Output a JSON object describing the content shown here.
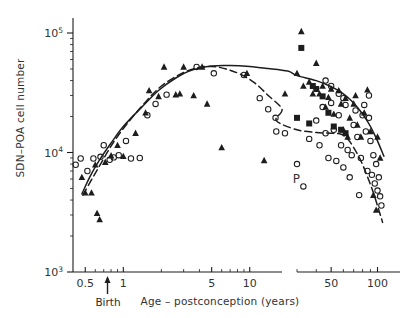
{
  "axes": {
    "ylabel": "SDN–POA cell number",
    "xlabel": "Age – postconception (years)",
    "birth_label": "Birth",
    "ytick_labels": [
      "10³",
      "10⁴",
      "10⁵"
    ],
    "xtick_labels": [
      "0.5",
      "1",
      "5",
      "10",
      "50",
      "100"
    ],
    "point_label": "P"
  },
  "chart_data": {
    "type": "scatter",
    "title": "",
    "xlabel": "Age – postconception (years)",
    "ylabel": "SDN–POA cell number",
    "xscale": "log",
    "yscale": "log",
    "xlim": [
      0.38,
      140
    ],
    "ylim": [
      1000,
      160000
    ],
    "axis_break": {
      "from": 18,
      "to": 30,
      "note": "break in x axis between 10 and 50 decades"
    },
    "grid": false,
    "legend": false,
    "ytick_values": [
      1000,
      10000,
      100000
    ],
    "ytick_labels": [
      "10³",
      "10⁴",
      "10⁵"
    ],
    "xtick_values": [
      0.5,
      1,
      5,
      10,
      50,
      100
    ],
    "xtick_labels": [
      "0.5",
      "1",
      "5",
      "10",
      "50",
      "100"
    ],
    "annotations": [
      {
        "text": "Birth",
        "x": 0.75,
        "y": 1000,
        "kind": "arrow-up-axis"
      },
      {
        "text": "P",
        "x": 33,
        "y": 5200,
        "kind": "point-label"
      }
    ],
    "series": [
      {
        "name": "male (filled triangles)",
        "marker": "triangle-filled",
        "color": "#000000",
        "points": [
          [
            0.47,
            6200
          ],
          [
            0.5,
            4600
          ],
          [
            0.56,
            4600
          ],
          [
            0.62,
            3100
          ],
          [
            0.65,
            2750
          ],
          [
            0.6,
            7900
          ],
          [
            0.72,
            8300
          ],
          [
            0.8,
            9400
          ],
          [
            0.9,
            11500
          ],
          [
            1.0,
            9300
          ],
          [
            1.25,
            14500
          ],
          [
            1.5,
            21500
          ],
          [
            1.6,
            33000
          ],
          [
            1.9,
            29500
          ],
          [
            2.1,
            52000
          ],
          [
            2.6,
            30500
          ],
          [
            2.8,
            31000
          ],
          [
            3.0,
            52000
          ],
          [
            3.6,
            30000
          ],
          [
            4.2,
            52000
          ],
          [
            4.6,
            25500
          ],
          [
            6.0,
            11000
          ],
          [
            9.5,
            46000
          ],
          [
            13.0,
            8600
          ],
          [
            19.0,
            31000
          ],
          [
            30.0,
            46000
          ],
          [
            32.0,
            103000
          ],
          [
            33.0,
            36000
          ],
          [
            36.0,
            39000
          ],
          [
            38.0,
            31000
          ],
          [
            40.0,
            56000
          ],
          [
            42.0,
            31000
          ],
          [
            44.0,
            36000
          ],
          [
            46.0,
            24000
          ],
          [
            48.0,
            29000
          ],
          [
            50.0,
            34000
          ],
          [
            52.0,
            21000
          ],
          [
            56.0,
            33000
          ],
          [
            58.0,
            25500
          ],
          [
            60.0,
            15500
          ],
          [
            62.0,
            28500
          ],
          [
            64.0,
            13500
          ],
          [
            66.0,
            19500
          ],
          [
            70.0,
            25500
          ],
          [
            72.0,
            30000
          ],
          [
            74.0,
            17000
          ],
          [
            78.0,
            13500
          ],
          [
            82.0,
            21500
          ],
          [
            86.0,
            33500
          ],
          [
            90.0,
            15000
          ],
          [
            94.0,
            4400
          ],
          [
            98.0,
            3300
          ],
          [
            100.0,
            13500
          ],
          [
            104.0,
            9000
          ]
        ]
      },
      {
        "name": "female (open circles)",
        "marker": "circle-open",
        "color": "#000000",
        "points": [
          [
            0.42,
            7900
          ],
          [
            0.46,
            8900
          ],
          [
            0.52,
            7000
          ],
          [
            0.58,
            8900
          ],
          [
            0.66,
            9200
          ],
          [
            0.7,
            11500
          ],
          [
            0.78,
            8700
          ],
          [
            0.84,
            9100
          ],
          [
            0.92,
            9500
          ],
          [
            1.05,
            12500
          ],
          [
            1.15,
            8900
          ],
          [
            1.35,
            9000
          ],
          [
            1.55,
            20500
          ],
          [
            1.8,
            25500
          ],
          [
            2.2,
            30500
          ],
          [
            3.8,
            52000
          ],
          [
            5.2,
            46000
          ],
          [
            9.0,
            44500
          ],
          [
            12.0,
            28500
          ],
          [
            14.0,
            23000
          ],
          [
            16.0,
            19500
          ],
          [
            19.0,
            14500
          ],
          [
            22.0,
            15000
          ],
          [
            33.0,
            5200
          ],
          [
            30.0,
            8000
          ],
          [
            36.0,
            13000
          ],
          [
            40.0,
            18500
          ],
          [
            42.0,
            11500
          ],
          [
            44.0,
            24000
          ],
          [
            46.0,
            14500
          ],
          [
            48.0,
            9000
          ],
          [
            50.0,
            26000
          ],
          [
            52.0,
            15500
          ],
          [
            54.0,
            8500
          ],
          [
            56.0,
            20500
          ],
          [
            58.0,
            11500
          ],
          [
            60.0,
            7500
          ],
          [
            62.0,
            25000
          ],
          [
            64.0,
            10500
          ],
          [
            66.0,
            6200
          ],
          [
            68.0,
            9500
          ],
          [
            70.0,
            17000
          ],
          [
            72.0,
            22500
          ],
          [
            74.0,
            13500
          ],
          [
            76.0,
            4400
          ],
          [
            78.0,
            9000
          ],
          [
            80.0,
            20500
          ],
          [
            82.0,
            25000
          ],
          [
            84.0,
            15000
          ],
          [
            86.0,
            7000
          ],
          [
            88.0,
            19500
          ],
          [
            90.0,
            12500
          ],
          [
            92.0,
            6500
          ],
          [
            94.0,
            9500
          ],
          [
            96.0,
            5500
          ],
          [
            98.0,
            8000
          ],
          [
            100.0,
            4800
          ],
          [
            102.0,
            6200
          ],
          [
            104.0,
            4300
          ],
          [
            106.0,
            3600
          ],
          [
            46.0,
            40000
          ],
          [
            50.0,
            36000
          ],
          [
            56.0,
            31000
          ],
          [
            60.0,
            28500
          ],
          [
            88.0,
            30000
          ]
        ]
      },
      {
        "name": "filled squares",
        "marker": "square-filled",
        "color": "#000000",
        "points": [
          [
            32.0,
            75000
          ],
          [
            38.0,
            36000
          ],
          [
            40.0,
            34000
          ],
          [
            44.0,
            29500
          ],
          [
            48.0,
            21500
          ],
          [
            52.0,
            16500
          ],
          [
            58.0,
            15500
          ],
          [
            62.0,
            14500
          ],
          [
            30.0,
            19500
          ],
          [
            36.0,
            17500
          ]
        ]
      }
    ],
    "fit_curves": [
      {
        "name": "male fit",
        "style": "solid",
        "color": "#000000",
        "points": [
          [
            0.47,
            4500
          ],
          [
            0.55,
            6400
          ],
          [
            0.65,
            8700
          ],
          [
            0.8,
            12000
          ],
          [
            1.0,
            16500
          ],
          [
            1.4,
            24000
          ],
          [
            1.9,
            33000
          ],
          [
            2.6,
            42000
          ],
          [
            3.5,
            49000
          ],
          [
            5.0,
            53000
          ],
          [
            7.0,
            53500
          ],
          [
            10.0,
            52500
          ],
          [
            14.0,
            50500
          ],
          [
            20.0,
            48000
          ],
          [
            30.0,
            44000
          ],
          [
            40.0,
            40000
          ],
          [
            50.0,
            35500
          ],
          [
            60.0,
            31000
          ],
          [
            70.0,
            26000
          ],
          [
            80.0,
            21000
          ],
          [
            90.0,
            16500
          ],
          [
            100.0,
            12500
          ],
          [
            110.0,
            9300
          ]
        ]
      },
      {
        "name": "female fit",
        "style": "dashed",
        "color": "#000000",
        "points": [
          [
            0.48,
            4400
          ],
          [
            0.58,
            6300
          ],
          [
            0.7,
            8900
          ],
          [
            0.85,
            12500
          ],
          [
            1.1,
            18000
          ],
          [
            1.5,
            26500
          ],
          [
            2.0,
            36000
          ],
          [
            2.8,
            45000
          ],
          [
            3.8,
            51000
          ],
          [
            5.0,
            52500
          ],
          [
            6.5,
            50000
          ],
          [
            8.5,
            45000
          ],
          [
            11.0,
            38000
          ],
          [
            14.0,
            30000
          ],
          [
            18.0,
            23000
          ],
          [
            22.0,
            18500
          ],
          [
            30.0,
            15500
          ],
          [
            40.0,
            14700
          ],
          [
            50.0,
            14500
          ],
          [
            58.0,
            14200
          ],
          [
            64.0,
            13000
          ],
          [
            70.0,
            11000
          ],
          [
            78.0,
            8500
          ],
          [
            86.0,
            6300
          ],
          [
            94.0,
            4600
          ],
          [
            102.0,
            3300
          ],
          [
            108.0,
            2600
          ]
        ]
      }
    ]
  }
}
